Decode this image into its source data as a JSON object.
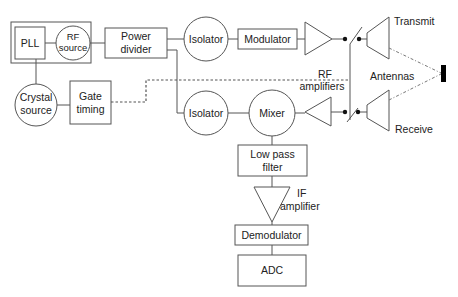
{
  "diagram": {
    "title": "",
    "blocks": {
      "pll": "PLL",
      "rf_source": [
        "RF",
        "source"
      ],
      "power_divider": [
        "Power",
        "divider"
      ],
      "crystal_source": [
        "Crystal",
        "source"
      ],
      "gate_timing": [
        "Gate",
        "timing"
      ],
      "isolator_tx": "Isolator",
      "isolator_rx": "Isolator",
      "modulator": "Modulator",
      "mixer": "Mixer",
      "low_pass_filter": [
        "Low pass",
        "filter"
      ],
      "if_amplifier": [
        "IF",
        "amplifier"
      ],
      "demodulator": "Demodulator",
      "adc": "ADC"
    },
    "labels": {
      "rf_amplifiers": [
        "RF",
        "amplifiers"
      ],
      "antennas": "Antennas",
      "transmit": "Transmit",
      "receive": "Receive"
    },
    "connections": [
      {
        "from": "PLL",
        "to": "RF source"
      },
      {
        "from": "PLL",
        "to": "Crystal source"
      },
      {
        "from": "RF source",
        "to": "Power divider"
      },
      {
        "from": "Crystal source",
        "to": "Gate timing"
      },
      {
        "from": "Gate timing",
        "to": "Antenna switches",
        "style": "dashed"
      },
      {
        "from": "Power divider",
        "to": "Isolator (TX)"
      },
      {
        "from": "Power divider",
        "to": "Isolator (RX)"
      },
      {
        "from": "Isolator (TX)",
        "to": "Modulator"
      },
      {
        "from": "Modulator",
        "to": "TX RF amplifier"
      },
      {
        "from": "TX RF amplifier",
        "to": "Transmit antenna",
        "via": "switch"
      },
      {
        "from": "Receive antenna",
        "to": "RX RF amplifier",
        "via": "switch"
      },
      {
        "from": "RX RF amplifier",
        "to": "Mixer"
      },
      {
        "from": "Isolator (RX)",
        "to": "Mixer"
      },
      {
        "from": "Mixer",
        "to": "Low pass filter"
      },
      {
        "from": "Low pass filter",
        "to": "IF amplifier"
      },
      {
        "from": "IF amplifier",
        "to": "Demodulator"
      },
      {
        "from": "Demodulator",
        "to": "ADC"
      },
      {
        "from": "Transmit antenna",
        "to": "Target",
        "style": "dotted"
      },
      {
        "from": "Target",
        "to": "Receive antenna",
        "style": "dotted"
      }
    ],
    "colors": {
      "line": "#555555",
      "text": "#222222",
      "target": "#000000",
      "background": "#ffffff"
    }
  }
}
